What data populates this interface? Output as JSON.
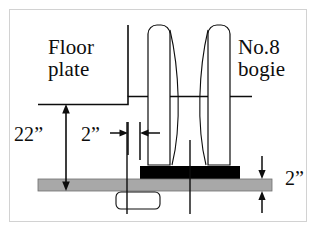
{
  "figure": {
    "type": "engineering-cross-section",
    "background_color": "#ffffff",
    "border_color": "#d2d2d2",
    "line_color": "#0d0d0d",
    "plate_fill_color": "#a8a8a8",
    "block_fill_color": "#000000"
  },
  "labels": {
    "floor_plate": "Floor\nplate",
    "bogie": "No.8\nbogie"
  },
  "dimensions": {
    "height": "22”",
    "offset": "2”",
    "thickness": "2”"
  },
  "parts": {
    "floor_plate_name": "floor-plate-line",
    "bogie_post_left_name": "bogie-post-left",
    "bogie_post_right_name": "bogie-post-right",
    "bogie_wheel_left_name": "bogie-wheel-profile-left",
    "bogie_wheel_right_name": "bogie-wheel-profile-right",
    "black_block_name": "black-mounting-block",
    "gray_plate_name": "gray-base-plate",
    "bottom_box_name": "bottom-rounded-box",
    "centerline_name": "vertical-centerline"
  }
}
